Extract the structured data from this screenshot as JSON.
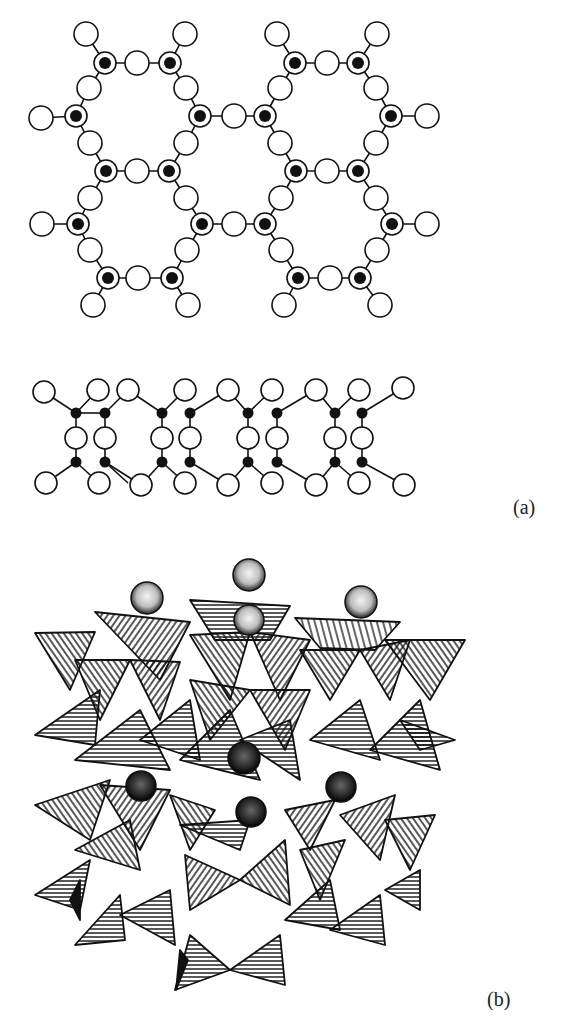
{
  "figure": {
    "panel_a": {
      "label": "(a)",
      "description": "Silicate framework: hexagonal ring network (top view) and side-view chain of tetrahedral units",
      "legend": {
        "oxygen": "open circle",
        "silicon": "filled circle",
        "silicon_overlapping_oxygen": "filled circle with ring"
      }
    },
    "panel_b": {
      "label": "(b)",
      "description": "Polyhedral representation of tetrahedral framework with stippled spherical cations in cages"
    }
  },
  "colors": {
    "ink": "#111111",
    "paper": "#ffffff"
  }
}
